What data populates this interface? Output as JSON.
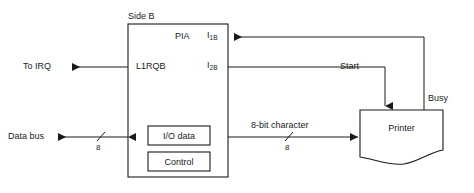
{
  "diagram": {
    "background_color": "#ffffff",
    "line_color": "#1a1a1a",
    "pia": {
      "side_label": "Side B",
      "name": "PIA",
      "irq_pin_label": "L1RQB",
      "interrupt_inputs": [
        {
          "base": "I",
          "sub": "1B"
        },
        {
          "base": "I",
          "sub": "2B"
        }
      ],
      "inner_blocks": [
        {
          "label": "I/O data"
        },
        {
          "label": "Control"
        }
      ]
    },
    "printer": {
      "label": "Printer"
    },
    "signals": {
      "to_irq": "To IRQ",
      "data_bus": "Data bus",
      "data_bus_width": "8",
      "character_bus": "8-bit character",
      "character_bus_width": "8",
      "start": "Start",
      "busy": "Busy"
    }
  }
}
